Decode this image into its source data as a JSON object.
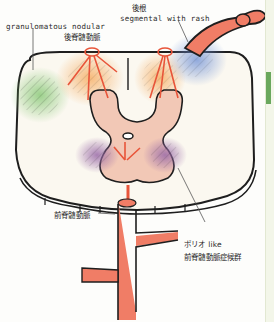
{
  "diagram": {
    "labels": {
      "dorsal_root": "後根",
      "segmental": "segmental with rash",
      "granulomatous": "granulomatous nodular",
      "posterior_spinal_artery": "後脊髄動脈",
      "anterior_spinal_artery": "前脊髄動脈",
      "polio_like": "ポリオ like",
      "anterior_spinal_artery_syndrome": "前脊髄動脈症候群"
    },
    "regions": [
      {
        "name": "granulomatous-nodular",
        "color": "#7cc36a",
        "position": "left lateral column"
      },
      {
        "name": "posterior-spinal-territory-left",
        "color": "#f5a04a",
        "position": "left dorsal column"
      },
      {
        "name": "posterior-spinal-territory-right",
        "color": "#f5a04a",
        "position": "right dorsal column"
      },
      {
        "name": "segmental-with-rash",
        "color": "#6d8fd6",
        "position": "right dorsal root entry zone"
      },
      {
        "name": "anterior-horn-left",
        "color": "#9a6aa8",
        "position": "left ventral horn"
      },
      {
        "name": "anterior-horn-right",
        "color": "#9a6aa8",
        "position": "right ventral horn"
      }
    ],
    "colors": {
      "artery": "#f07d66",
      "outline": "#1e1e1e",
      "gray_matter": "#f2c8b6",
      "white_matter": "#fbf8f0",
      "arrow": "#e8553a"
    }
  }
}
